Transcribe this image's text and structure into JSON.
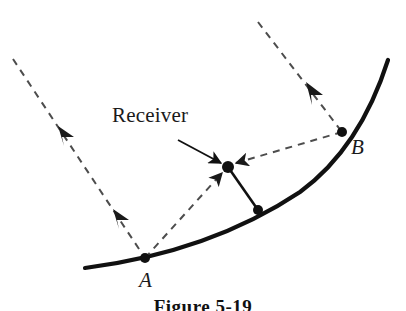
{
  "figure": {
    "caption": "Figure 5-19",
    "background_color": "#ffffff",
    "stroke_color": "#111111",
    "dashed_color": "#4d4d4d"
  },
  "labels": {
    "receiver": "Receiver",
    "point_a": "A",
    "point_b": "B"
  },
  "geometry": {
    "reflector_curve": {
      "name": "parabolic-reflector",
      "path": "M 85 268 Q 210 252 300 192 Q 360 148 388 60",
      "stroke_width": 4.2
    },
    "incoming_ray_left": {
      "name": "incoming-ray-left",
      "from": [
        13,
        59
      ],
      "to": [
        145,
        258
      ],
      "arrow_positions": [
        0.34,
        0.72
      ]
    },
    "incoming_ray_right": {
      "name": "incoming-ray-right",
      "from": [
        258,
        22
      ],
      "to": [
        342,
        132
      ],
      "arrow_positions": [
        0.77
      ]
    },
    "reflected_ray_a": {
      "name": "reflected-ray-from-a",
      "from": [
        145,
        258
      ],
      "to": [
        228,
        167
      ]
    },
    "reflected_ray_b": {
      "name": "reflected-ray-from-b",
      "from": [
        342,
        132
      ],
      "to": [
        228,
        167
      ]
    },
    "feed_strut": {
      "name": "receiver-support-strut",
      "from": [
        228,
        167
      ],
      "to": [
        258,
        210
      ]
    },
    "leader_line": {
      "name": "receiver-leader-line",
      "from": [
        178,
        140
      ],
      "to": [
        224,
        164
      ]
    },
    "points": [
      {
        "name": "point-a-dot",
        "cx": 145,
        "cy": 258,
        "r": 5
      },
      {
        "name": "point-b-dot",
        "cx": 342,
        "cy": 132,
        "r": 5
      },
      {
        "name": "receiver-dot",
        "cx": 228,
        "cy": 167,
        "r": 6
      },
      {
        "name": "strut-base-dot",
        "cx": 258,
        "cy": 210,
        "r": 5
      }
    ]
  }
}
